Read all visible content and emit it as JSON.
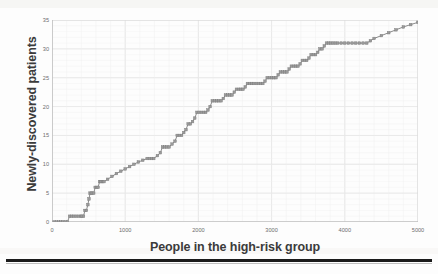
{
  "chart_data": {
    "type": "line",
    "title": "",
    "xlabel": "People in the high-risk group",
    "ylabel": "Newly-discovered patients",
    "xlim": [
      0,
      5000
    ],
    "ylim": [
      0,
      35
    ],
    "xticks": [
      0,
      1000,
      2000,
      3000,
      4000,
      5000
    ],
    "yticks": [
      0,
      5,
      10,
      15,
      20,
      25,
      30,
      35
    ],
    "xtick_labels": [
      "0",
      "1000",
      "2000",
      "3000",
      "4000",
      "5000"
    ],
    "ytick_labels": [
      "0",
      "5",
      "10",
      "15",
      "20",
      "25",
      "30",
      "35"
    ],
    "grid": true,
    "legend": false,
    "marker": "square",
    "series_color": "#8a8a8a",
    "grid_color": "#dcdcdc",
    "axis_color": "#b5b5b5",
    "series": [
      {
        "name": "Cumulative newly-discovered patients",
        "points": [
          [
            30,
            0
          ],
          [
            60,
            0
          ],
          [
            90,
            0
          ],
          [
            120,
            0
          ],
          [
            150,
            0
          ],
          [
            180,
            0
          ],
          [
            210,
            0
          ],
          [
            240,
            1
          ],
          [
            270,
            1
          ],
          [
            300,
            1
          ],
          [
            330,
            1
          ],
          [
            360,
            1
          ],
          [
            390,
            1
          ],
          [
            410,
            1
          ],
          [
            430,
            1
          ],
          [
            450,
            2
          ],
          [
            470,
            2
          ],
          [
            490,
            3
          ],
          [
            505,
            4
          ],
          [
            520,
            5
          ],
          [
            535,
            5
          ],
          [
            550,
            5
          ],
          [
            570,
            5
          ],
          [
            590,
            6
          ],
          [
            610,
            6
          ],
          [
            630,
            6
          ],
          [
            650,
            7
          ],
          [
            670,
            7
          ],
          [
            690,
            7
          ],
          [
            710,
            7
          ],
          [
            760,
            7.4
          ],
          [
            820,
            7.9
          ],
          [
            880,
            8.4
          ],
          [
            940,
            8.8
          ],
          [
            1000,
            9.2
          ],
          [
            1060,
            9.6
          ],
          [
            1120,
            10.0
          ],
          [
            1180,
            10.4
          ],
          [
            1240,
            10.7
          ],
          [
            1300,
            11
          ],
          [
            1330,
            11
          ],
          [
            1360,
            11
          ],
          [
            1390,
            11
          ],
          [
            1440,
            11.5
          ],
          [
            1480,
            12
          ],
          [
            1510,
            13
          ],
          [
            1540,
            13
          ],
          [
            1570,
            13
          ],
          [
            1600,
            13
          ],
          [
            1640,
            13.5
          ],
          [
            1680,
            14
          ],
          [
            1710,
            15
          ],
          [
            1740,
            15
          ],
          [
            1770,
            15
          ],
          [
            1800,
            15.5
          ],
          [
            1830,
            16
          ],
          [
            1860,
            17
          ],
          [
            1890,
            17
          ],
          [
            1920,
            17.4
          ],
          [
            1950,
            18
          ],
          [
            1980,
            19
          ],
          [
            2010,
            19
          ],
          [
            2040,
            19
          ],
          [
            2070,
            19
          ],
          [
            2100,
            19
          ],
          [
            2130,
            19.4
          ],
          [
            2160,
            20
          ],
          [
            2190,
            21
          ],
          [
            2220,
            21
          ],
          [
            2250,
            21
          ],
          [
            2280,
            21
          ],
          [
            2310,
            21
          ],
          [
            2340,
            21.4
          ],
          [
            2370,
            22
          ],
          [
            2400,
            22
          ],
          [
            2430,
            22
          ],
          [
            2460,
            22
          ],
          [
            2490,
            22.5
          ],
          [
            2520,
            23
          ],
          [
            2550,
            23
          ],
          [
            2580,
            23
          ],
          [
            2610,
            23
          ],
          [
            2640,
            23.4
          ],
          [
            2670,
            24
          ],
          [
            2700,
            24
          ],
          [
            2730,
            24
          ],
          [
            2760,
            24
          ],
          [
            2790,
            24
          ],
          [
            2820,
            24
          ],
          [
            2850,
            24
          ],
          [
            2880,
            24
          ],
          [
            2910,
            24.4
          ],
          [
            2940,
            25
          ],
          [
            2970,
            25
          ],
          [
            3000,
            25
          ],
          [
            3030,
            25
          ],
          [
            3060,
            25
          ],
          [
            3090,
            25.5
          ],
          [
            3120,
            26
          ],
          [
            3150,
            26
          ],
          [
            3180,
            26
          ],
          [
            3210,
            26
          ],
          [
            3240,
            26.5
          ],
          [
            3270,
            27
          ],
          [
            3300,
            27
          ],
          [
            3330,
            27
          ],
          [
            3360,
            27
          ],
          [
            3390,
            27.4
          ],
          [
            3420,
            28
          ],
          [
            3450,
            28
          ],
          [
            3480,
            28
          ],
          [
            3510,
            28.4
          ],
          [
            3540,
            29
          ],
          [
            3570,
            29
          ],
          [
            3600,
            29
          ],
          [
            3630,
            29.4
          ],
          [
            3660,
            30
          ],
          [
            3690,
            30
          ],
          [
            3720,
            30.5
          ],
          [
            3750,
            31
          ],
          [
            3780,
            31
          ],
          [
            3810,
            31
          ],
          [
            3840,
            31
          ],
          [
            3870,
            31
          ],
          [
            3900,
            31
          ],
          [
            3950,
            31
          ],
          [
            4000,
            31
          ],
          [
            4050,
            31
          ],
          [
            4100,
            31
          ],
          [
            4150,
            31
          ],
          [
            4200,
            31
          ],
          [
            4250,
            31
          ],
          [
            4300,
            31
          ],
          [
            4350,
            31.4
          ],
          [
            4400,
            31.8
          ],
          [
            4500,
            32.3
          ],
          [
            4600,
            32.8
          ],
          [
            4700,
            33.3
          ],
          [
            4800,
            33.8
          ],
          [
            4900,
            34.2
          ],
          [
            5000,
            34.6
          ]
        ]
      }
    ]
  },
  "axis": {
    "y_title": "Newly-discovered patients",
    "x_title": "People in the high-risk group"
  }
}
